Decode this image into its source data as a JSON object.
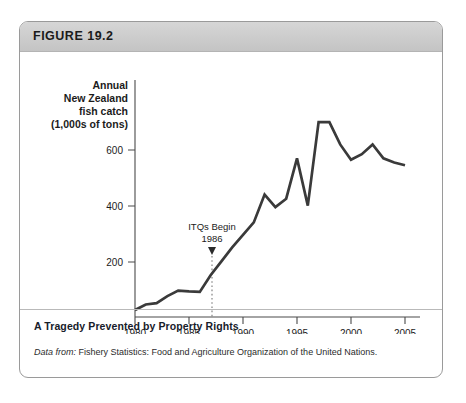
{
  "figure": {
    "number_label": "FIGURE 19.2",
    "caption": "A Tragedy Prevented by Property Rights",
    "source_prefix": "Data from:",
    "source_text": " Fishery Statistics: Food and Agriculture Organization of the United Nations."
  },
  "axis": {
    "y_label_line1": "Annual",
    "y_label_line2": "New Zealand",
    "y_label_line3": "fish catch",
    "y_label_line4": "(1,000s of tons)",
    "x_label": "Year",
    "y_ticks": [
      "200",
      "400",
      "600"
    ],
    "x_ticks": [
      "1980",
      "1985",
      "1990",
      "1995",
      "2000",
      "2005"
    ]
  },
  "annotation": {
    "line1": "ITQs Begin",
    "line2": "1986",
    "at_year": 1986
  },
  "colors": {
    "line": "#3a3a3a",
    "axis": "#4a4a4a",
    "header_bg": "#cccccc",
    "card_border": "#9a9a9a",
    "text": "#1b1b1b"
  },
  "chart_data": {
    "type": "line",
    "title": "A Tragedy Prevented by Property Rights",
    "xlabel": "Year",
    "ylabel": "Annual New Zealand fish catch (1,000s of tons)",
    "xlim": [
      1980,
      2005
    ],
    "ylim": [
      0,
      720
    ],
    "grid": false,
    "legend": null,
    "x": [
      1980,
      1981,
      1982,
      1983,
      1984,
      1985,
      1986,
      1987,
      1988,
      1989,
      1990,
      1991,
      1992,
      1993,
      1994,
      1995,
      1996,
      1997,
      1998,
      1999,
      2000,
      2001,
      2002,
      2003,
      2004,
      2005
    ],
    "values": [
      25,
      45,
      50,
      75,
      95,
      92,
      90,
      150,
      200,
      250,
      295,
      340,
      440,
      395,
      425,
      570,
      400,
      700,
      700,
      620,
      565,
      585,
      620,
      570,
      555,
      545
    ],
    "annotations": [
      {
        "text": "ITQs Begin 1986",
        "x": 1986,
        "type": "vertical-dotted-marker-with-arrow"
      }
    ]
  }
}
